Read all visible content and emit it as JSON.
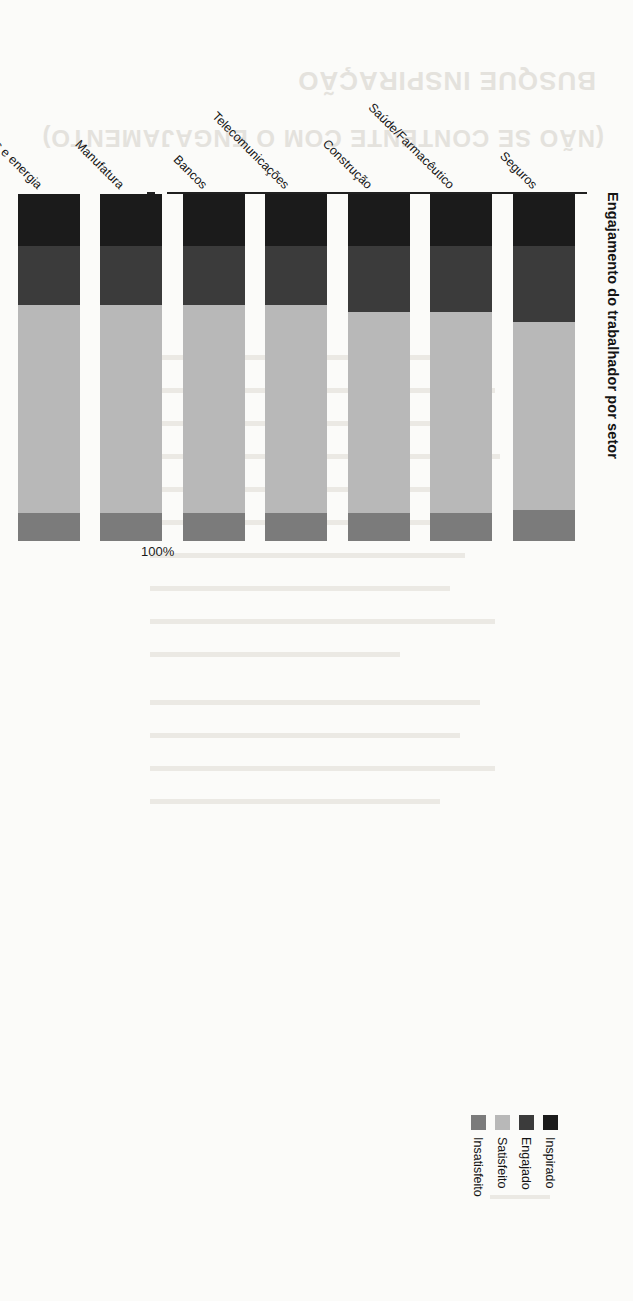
{
  "page": {
    "ghost_heading_line1": "BUSQUE INSPIRAÇÃO",
    "ghost_heading_line2": "(NÃO SE CONTENTE COM O ENGAJAMENTO)"
  },
  "chart_data": {
    "type": "bar",
    "subtype": "stacked-horizontal-100pct",
    "title": "Engajamento do trabalhador por setor",
    "xlabel": "",
    "ylabel": "",
    "ylim": [
      0,
      100
    ],
    "grid": false,
    "legend_position": "top-right",
    "axis_tick_labels": [
      "100%",
      "80",
      "60",
      "40",
      "20",
      "0"
    ],
    "axis_tick_values": [
      100,
      80,
      60,
      40,
      20,
      0
    ],
    "categories": [
      "Seguros",
      "Saúde/Farmacêutico",
      "Construção",
      "Telecomunicações",
      "Bancos",
      "Manufatura",
      "Recursos naturais e energia",
      "Mídia",
      "Outros serviços financeiros",
      "Varejo/Atacado",
      "Serviços profissionais",
      "Tecnologia"
    ],
    "series": [
      {
        "name": "Inspirado",
        "color": "#1b1b1b",
        "values": [
          15,
          15,
          15,
          15,
          15,
          15,
          15,
          15,
          15,
          15,
          15,
          15
        ]
      },
      {
        "name": "Engajado",
        "color": "#3b3b3b",
        "values": [
          22,
          19,
          19,
          17,
          17,
          17,
          17,
          17,
          17,
          17,
          17,
          17
        ]
      },
      {
        "name": "Satisfeito",
        "color": "#b8b8b8",
        "values": [
          54,
          58,
          58,
          60,
          60,
          60,
          60,
          60,
          60,
          60,
          61,
          61
        ]
      },
      {
        "name": "Insatisfeito",
        "color": "#7b7b7b",
        "values": [
          9,
          8,
          8,
          8,
          8,
          8,
          8,
          8,
          8,
          8,
          7,
          7
        ]
      }
    ]
  },
  "legend": {
    "items": [
      {
        "label": "Inspirado",
        "color": "#1b1b1b"
      },
      {
        "label": "Engajado",
        "color": "#3b3b3b"
      },
      {
        "label": "Satisfeito",
        "color": "#b8b8b8"
      },
      {
        "label": "Insatisfeito",
        "color": "#7b7b7b"
      }
    ]
  }
}
